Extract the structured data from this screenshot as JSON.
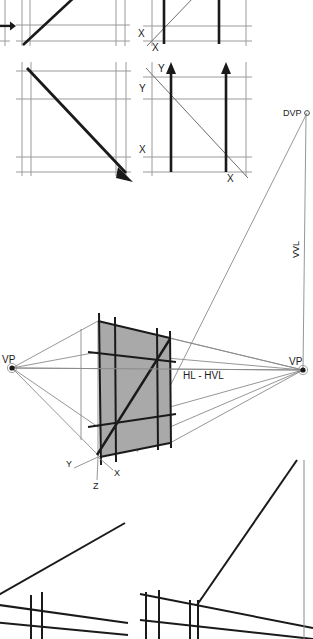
{
  "figure": {
    "type": "technical-perspective-construction-diagram",
    "background_color": "#ffffff",
    "ink_color": "#1a1a1a",
    "grid_color": "#9a9a9a",
    "plane_fill_color": "#a9a9a9",
    "width": 313,
    "height": 639
  },
  "panels": {
    "top_left": {
      "name": "grid-ascending-diagonal",
      "axis_labels": []
    },
    "top_right": {
      "name": "grid-vertical-bars-x",
      "axis_labels": [
        "X",
        "X"
      ]
    },
    "mid_left": {
      "name": "grid-descending-arrow",
      "axis_labels": []
    },
    "mid_right": {
      "name": "grid-vertical-arrows-xy",
      "axis_labels": [
        "Y",
        "Y",
        "X",
        "X"
      ]
    },
    "bottom_left": {
      "name": "converging-lines-detail-left",
      "axis_labels": []
    },
    "bottom_right": {
      "name": "converging-lines-detail-right",
      "axis_labels": []
    }
  },
  "perspective": {
    "vanishing_point_left": {
      "label": "VP",
      "x": 12,
      "y": 368
    },
    "vanishing_point_right": {
      "label": "VP",
      "x": 303,
      "y": 370
    },
    "diagonal_vanishing_point": {
      "label": "DVP",
      "x": 307,
      "y": 113
    },
    "vertical_vanishing_line": {
      "label": "VVL"
    },
    "horizon_line": {
      "label": "HL - HVL"
    },
    "axes": [
      {
        "label": "Y",
        "x": 70,
        "y": 463
      },
      {
        "label": "X",
        "x": 116,
        "y": 475
      },
      {
        "label": "Z",
        "x": 96,
        "y": 487
      }
    ]
  },
  "labels": {
    "vp": "VP",
    "dvp": "DVP",
    "vvl": "VVL",
    "hl_hvl": "HL - HVL",
    "x": "X",
    "y": "Y",
    "z": "Z"
  }
}
